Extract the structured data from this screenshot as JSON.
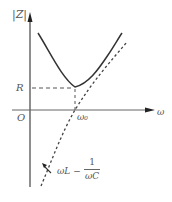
{
  "diagram": {
    "type": "impedance-vs-frequency",
    "y_axis_label": "|Z|",
    "x_axis_label": "ω",
    "origin_label": "O",
    "resistance_label": "R",
    "resonance_label": "ω₀",
    "reactance_label_prefix": "ωL −",
    "reactance_fraction_numerator": "1",
    "reactance_fraction_denominator": "ωC",
    "curves": [
      {
        "name": "impedance-magnitude",
        "style": "solid",
        "description": "U-shaped curve with minimum R at ω₀"
      },
      {
        "name": "reactance",
        "style": "dotted",
        "description": "ωL − 1/ωC, rising line crossing zero at ω₀"
      }
    ],
    "colors": {
      "axis": "#444444",
      "curve": "#333333",
      "guide": "#555555",
      "text": "#555555"
    }
  }
}
